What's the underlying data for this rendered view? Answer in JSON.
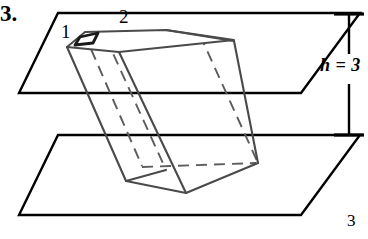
{
  "figure": {
    "problem_number": "3.",
    "page_number": "3",
    "labels": {
      "edge_one": "1",
      "edge_two": "2",
      "height": "h = 3"
    },
    "colors": {
      "ink": "#000000",
      "prism_stroke": "#4a4a4a",
      "hidden_stroke": "#6e6e6e",
      "background": "#ffffff"
    },
    "geometry": {
      "top_plane": "58,13 360,13 301,93 19,93",
      "bottom_plane": "58,135 360,135 301,215 19,215",
      "prism_top_face": "67,45 83,32 165,29 118,51",
      "prism_top_face_alt": "67,45 83,32 165,29 118,51",
      "small_top_quad": "78,36 97,33 92,42 74,44",
      "top_face_outline": "67,47 84,32 166,30 119,52",
      "solid_left_edge": "67,47 126,180",
      "solid_front_right_edge": "119,52 185,192",
      "solid_bottom_left": "126,180 185,192",
      "solid_bottom_right": "185,192 254,164",
      "right_top_edge": "166,30 234,40",
      "right_side_edge": "234,40 254,164",
      "hidden_vertical_1": "84,32 143,166",
      "hidden_vertical_2": "105,37 166,170",
      "hidden_bottom_edge": "143,166 254,164",
      "hidden_diagonal": "166,30 200,35"
    },
    "dimension": {
      "line_x": 349,
      "top_y": 13,
      "bottom_y": 135,
      "tick_half_width": 15
    }
  }
}
